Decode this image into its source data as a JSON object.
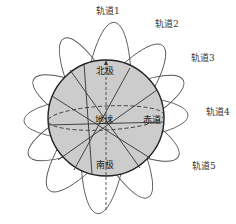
{
  "diagram": {
    "type": "satellite-orbits-around-earth",
    "globe": {
      "label": "地球",
      "north_pole": "北极",
      "south_pole": "南极",
      "equator": "赤道",
      "fill_color": "#cccccc",
      "outline_color": "#222222"
    },
    "orbits": [
      {
        "id": 1,
        "label": "轨道1"
      },
      {
        "id": 2,
        "label": "轨道2"
      },
      {
        "id": 3,
        "label": "轨道3"
      },
      {
        "id": 4,
        "label": "轨道4"
      },
      {
        "id": 5,
        "label": "轨道5"
      }
    ],
    "orbit_line_color": "#555555"
  }
}
